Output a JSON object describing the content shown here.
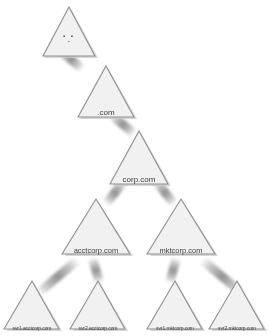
{
  "diagram": {
    "type": "tree",
    "background_color": "#ffffff",
    "node_fill_color": "#f1f1f1",
    "node_border_color": "#8f8f8f",
    "node_shadow_color": "#b8b8b8",
    "label_color": "#3b3b3b",
    "link_color": "#8c8c8c"
  },
  "nodes": {
    "root": {
      "label": "",
      "mark_row_1": "▪ ▪",
      "mark_row_2": "▪",
      "shape": "triangle",
      "level": 0
    },
    "com": {
      "label": ".com",
      "shape": "triangle",
      "level": 1
    },
    "corpcom": {
      "label": "corp.com",
      "shape": "triangle",
      "level": 2
    },
    "acctcorp": {
      "label": "acctcorp.com",
      "shape": "triangle",
      "level": 3
    },
    "mktcorp": {
      "label": "mktcorp.com",
      "shape": "triangle",
      "level": 3
    },
    "svr1acct": {
      "label": "svr1.acctcorp.com",
      "shape": "triangle",
      "level": 4
    },
    "svr2acct": {
      "label": "svr2.acctcorp.com",
      "shape": "triangle",
      "level": 4
    },
    "svr1mkt": {
      "label": "svr1.mktcorp.com",
      "shape": "triangle",
      "level": 4
    },
    "svr2mkt": {
      "label": "svr2.mktcorp.com",
      "shape": "triangle",
      "level": 4
    }
  },
  "edges": [
    {
      "from": "root",
      "to": "com"
    },
    {
      "from": "com",
      "to": "corpcom"
    },
    {
      "from": "corpcom",
      "to": "acctcorp"
    },
    {
      "from": "corpcom",
      "to": "mktcorp"
    },
    {
      "from": "acctcorp",
      "to": "svr1acct"
    },
    {
      "from": "acctcorp",
      "to": "svr2acct"
    },
    {
      "from": "mktcorp",
      "to": "svr1mkt"
    },
    {
      "from": "mktcorp",
      "to": "svr2mkt"
    }
  ]
}
